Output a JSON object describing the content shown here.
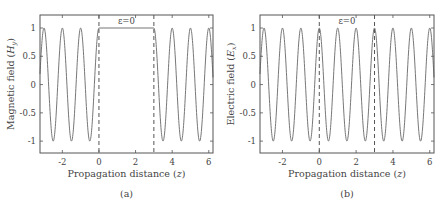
{
  "chart_data": [
    {
      "type": "line",
      "panel_label": "(a)",
      "title": "",
      "xlabel": "Propagation distance (z)",
      "ylabel": "Magnetic field (H_y)",
      "ylabel_main": "Magnetic field (",
      "ylabel_sym": "H",
      "ylabel_sub": "y",
      "xlim": [
        -3.22,
        6.23
      ],
      "ylim": [
        -1.21,
        1.23
      ],
      "xticks": [
        -2,
        0,
        2,
        4,
        6
      ],
      "yticks": [
        1,
        0.5,
        0,
        -0.5,
        -1
      ],
      "grid": false,
      "annotation": "ε=0",
      "annotation_region": [
        0,
        3
      ],
      "dashed_lines_x": [
        0,
        3
      ],
      "series": [
        {
          "name": "H_y",
          "function": "cos(2*pi*z)",
          "domain": [
            [
              -3.22,
              0
            ],
            [
              3,
              6.23
            ]
          ],
          "note": "field zero/absent inside the ε=0 slab (0 ≤ z ≤ 3); plotted as flat segment at y≈1.0 at top of slab"
        }
      ],
      "color": "#777777"
    },
    {
      "type": "line",
      "panel_label": "(b)",
      "title": "",
      "xlabel": "Propagation distance (z)",
      "ylabel": "Electric field (E_x)",
      "ylabel_main": "Electric field (",
      "ylabel_sym": "E",
      "ylabel_sub": "x",
      "xlim": [
        -3.22,
        6.23
      ],
      "ylim": [
        -1.21,
        1.23
      ],
      "xticks": [
        -2,
        0,
        2,
        4,
        6
      ],
      "yticks": [
        1,
        0.5,
        0,
        -0.5,
        -1
      ],
      "grid": false,
      "annotation": "ε=0",
      "annotation_region": [
        0,
        3
      ],
      "dashed_lines_x": [
        0,
        3
      ],
      "series": [
        {
          "name": "E_x",
          "function": "cos(2*pi*z)",
          "domain": [
            [
              -3.22,
              6.23
            ]
          ]
        }
      ],
      "color": "#777777"
    }
  ]
}
